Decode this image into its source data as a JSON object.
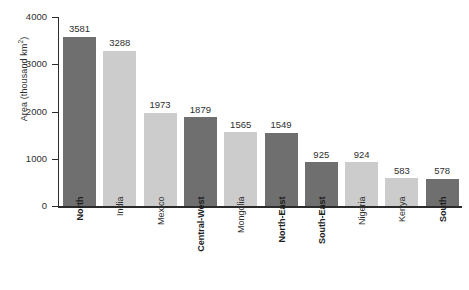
{
  "chart_data": {
    "type": "bar",
    "title": "",
    "xlabel": "",
    "ylabel": "Area (thousand km2)",
    "ylabel_text": "Area (thousand km",
    "ylabel_sup": "2",
    "ylabel_suffix": ")",
    "ylim": [
      0,
      4000
    ],
    "yticks": [
      0,
      1000,
      2000,
      3000,
      4000
    ],
    "ytick_labels": [
      "0",
      "1000",
      "2000",
      "3000",
      "4000"
    ],
    "grid": false,
    "legend": "none",
    "categories": [
      "North",
      "India",
      "Mexico",
      "Central-West",
      "Mongolia",
      "North-East",
      "South-East",
      "Nigeria",
      "Kenya",
      "South"
    ],
    "values": [
      3581,
      3288,
      1973,
      1879,
      1565,
      1549,
      925,
      924,
      583,
      578
    ],
    "value_labels": [
      "3581",
      "3288",
      "1973",
      "1879",
      "1565",
      "1549",
      "925",
      "924",
      "583",
      "578"
    ],
    "bar_styles": [
      "dark",
      "light",
      "light",
      "dark",
      "light",
      "dark",
      "dark",
      "light",
      "light",
      "dark"
    ],
    "label_emphasis": [
      "bold",
      "normal",
      "normal",
      "bold",
      "normal",
      "bold",
      "bold",
      "normal",
      "normal",
      "bold"
    ],
    "colors": {
      "dark_bar": "#6f6f6f",
      "light_bar": "#cccccc",
      "axis": "#2b2b2b",
      "text": "#2f2f2f",
      "background": "#ffffff"
    }
  }
}
